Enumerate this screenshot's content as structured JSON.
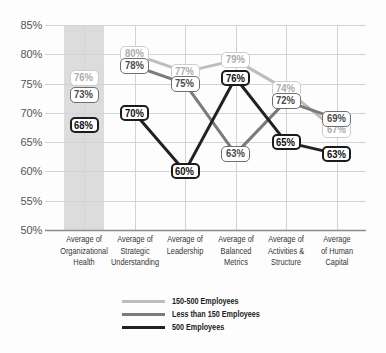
{
  "chart_data": {
    "type": "line",
    "title": "",
    "xlabel": "",
    "ylabel": "",
    "ylim": [
      50,
      85
    ],
    "grid": true,
    "legend_position": "bottom",
    "y_ticks": [
      50,
      55,
      60,
      65,
      70,
      75,
      80,
      85
    ],
    "y_tick_labels": [
      "50%",
      "55%",
      "60%",
      "65%",
      "70%",
      "75%",
      "80%",
      "85%"
    ],
    "categories": [
      "Average of Organizational Health",
      "Average of Strategic Understanding",
      "Average of Leadership",
      "Average of Balanced Metrics",
      "Average of Activities & Structure",
      "Average of Human Capital"
    ],
    "tick_labels": [
      "Average of\nOrganizational\nHealth",
      "Average of\nStrategic\nUnderstanding",
      "Average of\nLeadership",
      "Average of\nBalanced\nMetrics",
      "Average of\nActivities &\nStructure",
      "Average\nof Human\nCapital"
    ],
    "highlighted_category_index": 0,
    "highlight_color": "#dcdcdc",
    "lines_connect_from_index": 1,
    "series": [
      {
        "key": "150-500",
        "name": "150-500 Employees",
        "values": [
          76,
          80,
          77,
          79,
          74,
          67
        ],
        "labels": [
          "76%",
          "80%",
          "77%",
          "79%",
          "74%",
          "67%"
        ],
        "line_color": "#bdbdbd",
        "label_border": "#cdcdcd",
        "label_text": "#ababab"
      },
      {
        "key": "less-than-150",
        "name": "Less than 150 Employees",
        "values": [
          73,
          78,
          75,
          63,
          72,
          69
        ],
        "labels": [
          "73%",
          "78%",
          "75%",
          "63%",
          "72%",
          "69%"
        ],
        "line_color": "#7b7b7b",
        "label_border": "#6e6e6e",
        "label_text": "#4a4a4a"
      },
      {
        "key": "500",
        "name": "500 Employees",
        "values": [
          68,
          70,
          60,
          76,
          65,
          63
        ],
        "labels": [
          "68%",
          "70%",
          "60%",
          "76%",
          "65%",
          "63%"
        ],
        "line_color": "#222222",
        "label_border": "#1c1c1c",
        "label_text": "#111111"
      }
    ]
  }
}
